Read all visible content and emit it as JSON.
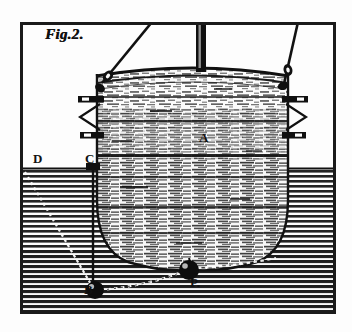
{
  "figure": {
    "caption": "Fig.2.",
    "labels": [
      {
        "id": "A",
        "text": "A",
        "meaning": "diving bell body",
        "x": 205,
        "y": 138
      },
      {
        "id": "B",
        "text": "B",
        "meaning": "plumb weight on vertical line from C",
        "x": 95,
        "y": 289
      },
      {
        "id": "C",
        "text": "C",
        "meaning": "water surface point at line origin",
        "x": 92,
        "y": 160
      },
      {
        "id": "D",
        "text": "D",
        "meaning": "water surface reference point at left",
        "x": 40,
        "y": 160
      },
      {
        "id": "P",
        "text": "P.",
        "meaning": "weight hanging beneath the bell",
        "x": 196,
        "y": 283
      }
    ]
  },
  "colors": {
    "paper": "#fdfdfd",
    "ink": "#111111",
    "frame": "#1a1a1a",
    "hatch": "#222222",
    "highlight": "#ffffff"
  },
  "geometry": {
    "frame": {
      "x": 20,
      "y": 22,
      "width": 315,
      "height": 291
    },
    "waterline_y": 168,
    "bell": {
      "left": 96,
      "right": 289,
      "rim_y": 72,
      "bottom_y": 266
    },
    "hoist_rope": {
      "x": 196,
      "width": 10,
      "top": 22,
      "bottom": 70
    },
    "cables": [
      {
        "name": "left-cable",
        "x1": 150,
        "y1": 22,
        "x2": 100,
        "y2": 85
      },
      {
        "name": "right-cable",
        "x1": 296,
        "y1": 22,
        "x2": 286,
        "y2": 86
      }
    ],
    "plumb_line": {
      "x": 93,
      "y1": 170,
      "y2": 288
    },
    "dotted_diagonal": {
      "x1": 26,
      "y1": 172,
      "x2": 92,
      "y2": 286
    },
    "dotted_arc": {
      "from": "B",
      "to": "P"
    }
  },
  "elements": {
    "frame_name": "plate-border",
    "water_name": "water-hatching",
    "bell_name": "diving-bell",
    "rope_name": "hoist-rope",
    "ball_b_name": "weight-b",
    "ball_p_name": "weight-p"
  }
}
